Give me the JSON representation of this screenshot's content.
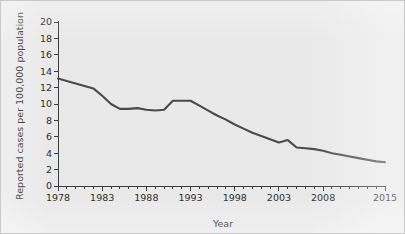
{
  "chart_data": {
    "type": "line",
    "title": "",
    "xlabel": "Year",
    "ylabel": "Reported cases per 100,000 population",
    "xlim": [
      1978,
      2015
    ],
    "ylim": [
      0,
      20
    ],
    "grid": false,
    "legend": null,
    "x_tick_labels": [
      "1978",
      "1983",
      "1988",
      "1993",
      "1998",
      "2003",
      "2008",
      "2015"
    ],
    "x_tick_values": [
      1978,
      1983,
      1988,
      1993,
      1998,
      2003,
      2008,
      2015
    ],
    "x_minor_tick_step": 1,
    "y_tick_labels": [
      "0",
      "2",
      "4",
      "6",
      "8",
      "10",
      "12",
      "14",
      "16",
      "18",
      "20"
    ],
    "y_tick_values": [
      0,
      2,
      4,
      6,
      8,
      10,
      12,
      14,
      16,
      18,
      20
    ],
    "series": [
      {
        "name": "Reported cases per 100,000 population",
        "color": "#4a4a4a",
        "x": [
          1978,
          1979,
          1980,
          1981,
          1982,
          1983,
          1984,
          1985,
          1986,
          1987,
          1988,
          1989,
          1990,
          1991,
          1992,
          1993,
          1994,
          1995,
          1996,
          1997,
          1998,
          1999,
          2000,
          2001,
          2002,
          2003,
          2004,
          2005,
          2006,
          2007,
          2008,
          2009,
          2010,
          2011,
          2012,
          2013,
          2014,
          2015
        ],
        "values": [
          13.1,
          12.8,
          12.5,
          12.2,
          11.9,
          11.0,
          10.0,
          9.4,
          9.4,
          9.5,
          9.3,
          9.2,
          9.3,
          10.4,
          10.4,
          10.4,
          9.8,
          9.2,
          8.6,
          8.1,
          7.5,
          7.0,
          6.5,
          6.1,
          5.7,
          5.3,
          5.6,
          4.7,
          4.6,
          4.5,
          4.3,
          4.0,
          3.8,
          3.6,
          3.4,
          3.2,
          3.0,
          2.9
        ]
      }
    ]
  },
  "axes": {
    "y_title": "Reported cases per 100,000 population",
    "x_title": "Year"
  }
}
